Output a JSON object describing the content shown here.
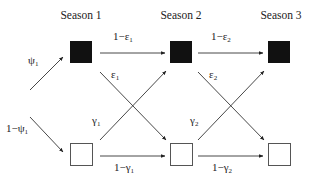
{
  "diagram": {
    "seasons": [
      {
        "label": "Season 1"
      },
      {
        "label": "Season 2"
      },
      {
        "label": "Season 3"
      }
    ],
    "states": {
      "occupied": {
        "color": "#111111",
        "description": "filled square"
      },
      "unoccupied": {
        "color": "#ffffff",
        "description": "empty square"
      }
    },
    "edges": [
      {
        "from": "start",
        "to": "S1-occupied",
        "label": "ψ",
        "subscript": "1"
      },
      {
        "from": "start",
        "to": "S1-unoccupied",
        "label": "1−ψ",
        "subscript": "1"
      },
      {
        "from": "S1-occupied",
        "to": "S2-occupied",
        "label": "1−ε",
        "subscript": "1"
      },
      {
        "from": "S1-occupied",
        "to": "S2-unoccupied",
        "label": "ε",
        "subscript": "1"
      },
      {
        "from": "S1-unoccupied",
        "to": "S2-occupied",
        "label": "γ",
        "subscript": "1"
      },
      {
        "from": "S1-unoccupied",
        "to": "S2-unoccupied",
        "label": "1−γ",
        "subscript": "1"
      },
      {
        "from": "S2-occupied",
        "to": "S3-occupied",
        "label": "1−ε",
        "subscript": "2"
      },
      {
        "from": "S2-occupied",
        "to": "S3-unoccupied",
        "label": "ε",
        "subscript": "2"
      },
      {
        "from": "S2-unoccupied",
        "to": "S3-occupied",
        "label": "γ",
        "subscript": "2"
      },
      {
        "from": "S2-unoccupied",
        "to": "S3-unoccupied",
        "label": "1−γ",
        "subscript": "2"
      }
    ]
  }
}
